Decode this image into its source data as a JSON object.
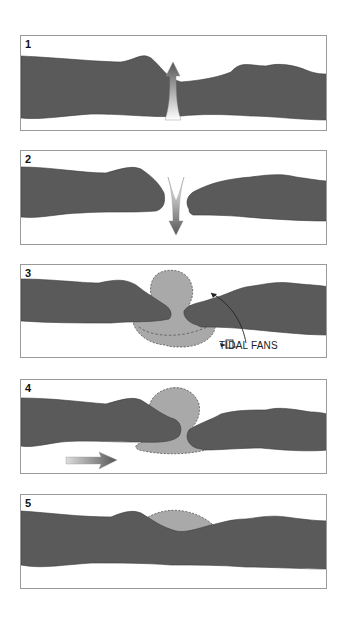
{
  "diagram": {
    "colors": {
      "barrier": "#5a5a5a",
      "barrier_edge": "#333333",
      "fan": "#a9a9a9",
      "fan_edge": "#555555",
      "border": "#9a9a9a",
      "background": "#ffffff"
    },
    "panels": [
      {
        "number": "1",
        "description": "Barrier island with storm overwash / breach, arrow pointing up (seaward flow)",
        "arrow": "up-arrow"
      },
      {
        "number": "2",
        "description": "Barrier island breached, inlet opens, arrow pointing down (landward flow)",
        "arrow": "down-arrow"
      },
      {
        "number": "3",
        "description": "Tidal inlet with flood and ebb tidal fans",
        "label": "TIDAL FANS"
      },
      {
        "number": "4",
        "description": "Inlet narrowing, longshore drift arrow to the right",
        "arrow": "right-arrow"
      },
      {
        "number": "5",
        "description": "Inlet closed, relict flood tidal fan remains"
      }
    ]
  }
}
